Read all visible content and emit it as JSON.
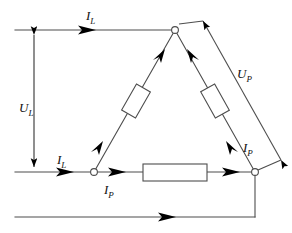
{
  "diagram": {
    "type": "electrical-schematic",
    "stroke_color": "#4d4d4d",
    "arrow_color": "#000000",
    "node_fill": "#ffffff",
    "background": "#ffffff",
    "labels": {
      "u_l": {
        "symbol": "U",
        "subscript": "L",
        "text": "UL",
        "meaning": "line voltage"
      },
      "u_p": {
        "symbol": "U",
        "subscript": "P",
        "text": "UP",
        "meaning": "phase voltage"
      },
      "i_l_top": {
        "symbol": "I",
        "subscript": "L",
        "text": "IL",
        "meaning": "line current (upper supply wire)"
      },
      "i_l_bottom": {
        "symbol": "I",
        "subscript": "L",
        "text": "IL",
        "meaning": "line current (lower supply wire)"
      },
      "i_p_bottom": {
        "symbol": "I",
        "subscript": "P",
        "text": "IP",
        "meaning": "phase current (bottom branch)"
      },
      "i_p_right": {
        "symbol": "I",
        "subscript": "P",
        "text": "IP",
        "meaning": "phase current (right branch)"
      }
    },
    "nodes": [
      {
        "name": "top-vertex",
        "x": 175,
        "y": 30
      },
      {
        "name": "bottom-left-vertex",
        "x": 94,
        "y": 172
      },
      {
        "name": "bottom-right-vertex",
        "x": 255,
        "y": 172
      }
    ],
    "resistors": [
      {
        "name": "resistor-left-branch",
        "orientation": "diagonal"
      },
      {
        "name": "resistor-right-branch",
        "orientation": "diagonal"
      },
      {
        "name": "resistor-bottom-branch",
        "orientation": "horizontal"
      }
    ],
    "wires": [
      {
        "name": "supply-wire-top",
        "from_x": 15,
        "from_y": 30,
        "to_x": 175,
        "to_y": 30
      },
      {
        "name": "supply-wire-middle",
        "from_x": 15,
        "from_y": 172,
        "to_x": 94,
        "to_y": 172
      },
      {
        "name": "supply-wire-bottom",
        "from_x": 15,
        "from_y": 217,
        "to_x": 255,
        "to_y": 217
      }
    ]
  }
}
